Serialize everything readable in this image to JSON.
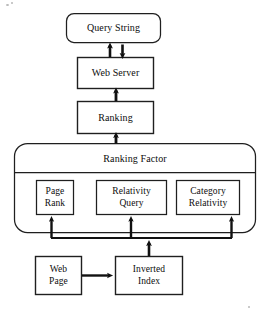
{
  "diagram": {
    "type": "flowchart",
    "style": {
      "stroke": "#1a1a1a",
      "fill": "#ffffff",
      "background": "#ffffff"
    },
    "nodes": [
      {
        "id": "query-string",
        "label": "Query String",
        "shape": "rounded-rectangle",
        "x": 66,
        "y": 13,
        "w": 95,
        "h": 30
      },
      {
        "id": "web-server",
        "label": "Web Server",
        "shape": "rectangle",
        "x": 77,
        "y": 57,
        "w": 77,
        "h": 32
      },
      {
        "id": "ranking",
        "label": "Ranking",
        "shape": "rectangle",
        "x": 77,
        "y": 101,
        "w": 77,
        "h": 33
      },
      {
        "id": "ranking-factor",
        "label": "Ranking Factor",
        "shape": "rounded-rectangle-container",
        "x": 14,
        "y": 143,
        "w": 242,
        "h": 90
      },
      {
        "id": "page-rank",
        "label": "Page\nRank",
        "shape": "rectangle",
        "x": 36,
        "y": 180,
        "w": 38,
        "h": 35
      },
      {
        "id": "relativity-query",
        "label": "Relativity\nQuery",
        "shape": "rectangle",
        "x": 96,
        "y": 180,
        "w": 71,
        "h": 35
      },
      {
        "id": "category-relativity",
        "label": "Category\nRelativity",
        "shape": "rectangle",
        "x": 176,
        "y": 180,
        "w": 64,
        "h": 35
      },
      {
        "id": "web-page",
        "label": "Web\nPage",
        "shape": "rectangle",
        "x": 35,
        "y": 256,
        "w": 47,
        "h": 39
      },
      {
        "id": "inverted-index",
        "label": "Inverted\nIndex",
        "shape": "rectangle",
        "x": 115,
        "y": 256,
        "w": 68,
        "h": 39
      }
    ],
    "edges": [
      {
        "id": "web-server-to-query-string",
        "from": "web-server",
        "to": "query-string",
        "direction": "up"
      },
      {
        "id": "query-string-to-web-server",
        "from": "query-string",
        "to": "web-server",
        "direction": "down"
      },
      {
        "id": "ranking-to-web-server",
        "from": "ranking",
        "to": "web-server",
        "direction": "up"
      },
      {
        "id": "ranking-factor-to-ranking",
        "from": "ranking-factor",
        "to": "ranking",
        "direction": "up"
      },
      {
        "id": "bus-to-page-rank",
        "from": "factor-bus",
        "to": "page-rank",
        "direction": "up"
      },
      {
        "id": "bus-to-relativity-query",
        "from": "factor-bus",
        "to": "relativity-query",
        "direction": "up"
      },
      {
        "id": "bus-to-category-relativity",
        "from": "factor-bus",
        "to": "category-relativity",
        "direction": "up"
      },
      {
        "id": "inverted-index-to-bus",
        "from": "inverted-index",
        "to": "factor-bus",
        "direction": "up"
      },
      {
        "id": "web-page-to-inverted-index",
        "from": "web-page",
        "to": "inverted-index",
        "direction": "right"
      }
    ]
  }
}
